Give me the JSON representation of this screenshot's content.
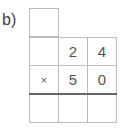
{
  "problem": {
    "label": "b)",
    "carry_row": [
      ""
    ],
    "rows": [
      [
        "",
        "2",
        "4"
      ],
      [
        "×",
        "5",
        "0"
      ],
      [
        "",
        "",
        ""
      ]
    ]
  }
}
